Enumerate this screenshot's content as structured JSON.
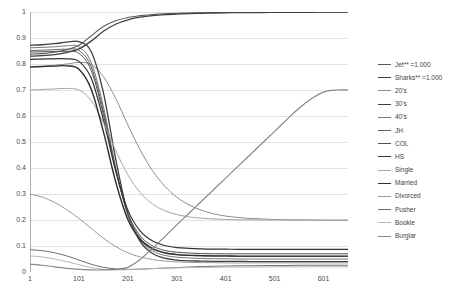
{
  "chart_data": {
    "type": "line",
    "title": "",
    "xlabel": "",
    "ylabel": "",
    "xlim": [
      1,
      651
    ],
    "ylim": [
      0,
      1
    ],
    "xticks": [
      "1",
      "101",
      "201",
      "301",
      "401",
      "501",
      "601"
    ],
    "xtick_values": [
      1,
      101,
      201,
      301,
      401,
      501,
      601
    ],
    "yticks": [
      "0",
      "0.1",
      "0.2",
      "0.3",
      "0.4",
      "0.5",
      "0.6",
      "0.7",
      "0.8",
      "0.9",
      "1"
    ],
    "ytick_values": [
      0,
      0.1,
      0.2,
      0.3,
      0.4,
      0.5,
      0.6,
      0.7,
      0.8,
      0.9,
      1
    ],
    "grid": "horizontal",
    "legend_position": "right",
    "background_color": "#ffffff",
    "gridline_color": "#d9d9d9",
    "axis_color": "#b0b0b0",
    "x": [
      1,
      26,
      51,
      76,
      101,
      126,
      151,
      176,
      201,
      226,
      251,
      276,
      301,
      326,
      351,
      376,
      401,
      426,
      451,
      476,
      501,
      526,
      551,
      576,
      601,
      626,
      651
    ],
    "series": [
      {
        "name": "Jet** =1.000",
        "color": "#595959",
        "width": 1.1,
        "values": [
          0.838,
          0.84,
          0.845,
          0.855,
          0.872,
          0.908,
          0.944,
          0.966,
          0.979,
          0.986,
          0.99,
          0.993,
          0.995,
          0.996,
          0.997,
          0.998,
          0.998,
          0.998,
          0.999,
          0.999,
          0.999,
          0.999,
          0.999,
          1.0,
          1.0,
          1.0,
          1.0
        ]
      },
      {
        "name": "Sharks** =1.000",
        "color": "#3f3f3f",
        "width": 1.3,
        "values": [
          0.83,
          0.832,
          0.836,
          0.844,
          0.858,
          0.888,
          0.926,
          0.953,
          0.97,
          0.98,
          0.986,
          0.99,
          0.992,
          0.994,
          0.995,
          0.996,
          0.997,
          0.998,
          0.998,
          0.998,
          0.999,
          0.999,
          0.999,
          0.999,
          1.0,
          1.0,
          1.0
        ]
      },
      {
        "name": "20's",
        "color": "#8c8c8c",
        "width": 1.0,
        "values": [
          0.79,
          0.792,
          0.795,
          0.8,
          0.806,
          0.798,
          0.752,
          0.668,
          0.566,
          0.47,
          0.391,
          0.331,
          0.288,
          0.258,
          0.238,
          0.224,
          0.215,
          0.21,
          0.206,
          0.204,
          0.202,
          0.201,
          0.2,
          0.2,
          0.199,
          0.199,
          0.199
        ]
      },
      {
        "name": "30's",
        "color": "#404040",
        "width": 1.3,
        "values": [
          0.872,
          0.874,
          0.878,
          0.884,
          0.886,
          0.848,
          0.69,
          0.436,
          0.224,
          0.118,
          0.072,
          0.053,
          0.046,
          0.043,
          0.042,
          0.041,
          0.041,
          0.041,
          0.04,
          0.04,
          0.04,
          0.04,
          0.04,
          0.04,
          0.04,
          0.04,
          0.04
        ]
      },
      {
        "name": "40's",
        "color": "#767676",
        "width": 1.0,
        "values": [
          0.862,
          0.864,
          0.866,
          0.87,
          0.866,
          0.806,
          0.636,
          0.404,
          0.218,
          0.124,
          0.082,
          0.064,
          0.057,
          0.054,
          0.052,
          0.051,
          0.051,
          0.05,
          0.05,
          0.05,
          0.05,
          0.05,
          0.05,
          0.05,
          0.05,
          0.05,
          0.05
        ]
      },
      {
        "name": "JH",
        "color": "#606060",
        "width": 1.0,
        "values": [
          0.852,
          0.853,
          0.855,
          0.857,
          0.852,
          0.79,
          0.62,
          0.398,
          0.222,
          0.132,
          0.092,
          0.074,
          0.067,
          0.064,
          0.062,
          0.061,
          0.061,
          0.06,
          0.06,
          0.06,
          0.06,
          0.06,
          0.06,
          0.06,
          0.06,
          0.06,
          0.06
        ]
      },
      {
        "name": "COL",
        "color": "#4f4f4f",
        "width": 1.0,
        "values": [
          0.846,
          0.847,
          0.848,
          0.849,
          0.841,
          0.776,
          0.606,
          0.392,
          0.226,
          0.14,
          0.101,
          0.083,
          0.076,
          0.073,
          0.071,
          0.07,
          0.07,
          0.07,
          0.07,
          0.07,
          0.07,
          0.07,
          0.07,
          0.07,
          0.07,
          0.07,
          0.07
        ]
      },
      {
        "name": "HS",
        "color": "#333333",
        "width": 1.2,
        "values": [
          0.818,
          0.819,
          0.82,
          0.82,
          0.81,
          0.746,
          0.586,
          0.39,
          0.238,
          0.158,
          0.12,
          0.102,
          0.094,
          0.091,
          0.089,
          0.088,
          0.088,
          0.087,
          0.087,
          0.087,
          0.087,
          0.087,
          0.087,
          0.087,
          0.087,
          0.087,
          0.087
        ]
      },
      {
        "name": "Single",
        "color": "#a6a6a6",
        "width": 1.0,
        "values": [
          0.7,
          0.702,
          0.704,
          0.706,
          0.7,
          0.66,
          0.574,
          0.468,
          0.374,
          0.306,
          0.262,
          0.236,
          0.221,
          0.212,
          0.207,
          0.204,
          0.202,
          0.201,
          0.201,
          0.2,
          0.2,
          0.2,
          0.2,
          0.2,
          0.2,
          0.2,
          0.2
        ]
      },
      {
        "name": "Married",
        "color": "#2e2e2e",
        "width": 1.4,
        "values": [
          0.788,
          0.79,
          0.792,
          0.793,
          0.78,
          0.704,
          0.54,
          0.348,
          0.202,
          0.126,
          0.09,
          0.074,
          0.067,
          0.064,
          0.063,
          0.062,
          0.062,
          0.061,
          0.061,
          0.061,
          0.061,
          0.061,
          0.061,
          0.061,
          0.061,
          0.061,
          0.061
        ]
      },
      {
        "name": "Divorced",
        "color": "#9a9a9a",
        "width": 1.0,
        "values": [
          0.3,
          0.288,
          0.268,
          0.24,
          0.206,
          0.168,
          0.13,
          0.098,
          0.074,
          0.058,
          0.048,
          0.042,
          0.039,
          0.037,
          0.036,
          0.036,
          0.035,
          0.035,
          0.035,
          0.035,
          0.035,
          0.035,
          0.035,
          0.035,
          0.035,
          0.035,
          0.035
        ]
      },
      {
        "name": "Pusher",
        "color": "#6e6e6e",
        "width": 1.0,
        "values": [
          0.086,
          0.082,
          0.074,
          0.062,
          0.046,
          0.03,
          0.018,
          0.012,
          0.01,
          0.011,
          0.013,
          0.015,
          0.017,
          0.019,
          0.021,
          0.022,
          0.023,
          0.024,
          0.024,
          0.025,
          0.025,
          0.025,
          0.026,
          0.026,
          0.026,
          0.026,
          0.026
        ]
      },
      {
        "name": "Bookie",
        "color": "#b5b5b5",
        "width": 1.0,
        "values": [
          0.062,
          0.058,
          0.05,
          0.04,
          0.028,
          0.017,
          0.01,
          0.008,
          0.009,
          0.011,
          0.013,
          0.015,
          0.016,
          0.017,
          0.018,
          0.018,
          0.019,
          0.019,
          0.019,
          0.019,
          0.02,
          0.02,
          0.02,
          0.02,
          0.02,
          0.02,
          0.02
        ]
      },
      {
        "name": "Burglar",
        "color": "#878787",
        "width": 1.2,
        "values": [
          0.03,
          0.026,
          0.02,
          0.014,
          0.01,
          0.008,
          0.008,
          0.01,
          0.018,
          0.048,
          0.09,
          0.135,
          0.181,
          0.226,
          0.271,
          0.316,
          0.361,
          0.406,
          0.451,
          0.496,
          0.541,
          0.586,
          0.63,
          0.666,
          0.692,
          0.7,
          0.7
        ]
      }
    ]
  }
}
